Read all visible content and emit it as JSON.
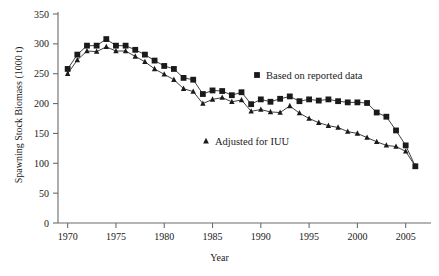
{
  "chart_data": {
    "type": "line",
    "title": "",
    "xlabel": "Year",
    "ylabel": "Spawning Stock Biomass (1000 t)",
    "xlim": [
      1969,
      2007
    ],
    "ylim": [
      0,
      350
    ],
    "xticks": [
      1970,
      1975,
      1980,
      1985,
      1990,
      1995,
      2000,
      2005
    ],
    "xtick_labels": [
      "1970",
      "1975",
      "1980",
      "1985",
      "1990",
      "1995",
      "2000",
      "2005"
    ],
    "yticks": [
      0,
      50,
      100,
      150,
      200,
      250,
      300,
      350
    ],
    "ytick_labels": [
      "0",
      "50",
      "100",
      "150",
      "200",
      "250",
      "300",
      "350"
    ],
    "grid": false,
    "legend_position": "inside-right",
    "x": [
      1970,
      1971,
      1972,
      1973,
      1974,
      1975,
      1976,
      1977,
      1978,
      1979,
      1980,
      1981,
      1982,
      1983,
      1984,
      1985,
      1986,
      1987,
      1988,
      1989,
      1990,
      1991,
      1992,
      1993,
      1994,
      1995,
      1996,
      1997,
      1998,
      1999,
      2000,
      2001,
      2002,
      2003,
      2004,
      2005,
      2006
    ],
    "series": [
      {
        "name": "Based on reported data",
        "marker": "square",
        "values": [
          258,
          282,
          297,
          297,
          308,
          297,
          297,
          290,
          282,
          272,
          263,
          258,
          243,
          240,
          216,
          222,
          221,
          214,
          219,
          199,
          207,
          203,
          208,
          212,
          204,
          207,
          205,
          207,
          204,
          202,
          202,
          201,
          185,
          178,
          155,
          130,
          95
        ]
      },
      {
        "name": "Adjusted for IUU",
        "marker": "triangle",
        "values": [
          250,
          273,
          288,
          287,
          295,
          288,
          288,
          279,
          270,
          258,
          249,
          240,
          225,
          220,
          200,
          207,
          210,
          203,
          206,
          187,
          190,
          186,
          185,
          196,
          184,
          175,
          168,
          163,
          160,
          153,
          150,
          143,
          136,
          130,
          128,
          120,
          95
        ]
      }
    ]
  },
  "legend": {
    "items": [
      {
        "label": "Based on reported data",
        "marker": "square"
      },
      {
        "label": "Adjusted for IUU",
        "marker": "triangle"
      }
    ]
  }
}
